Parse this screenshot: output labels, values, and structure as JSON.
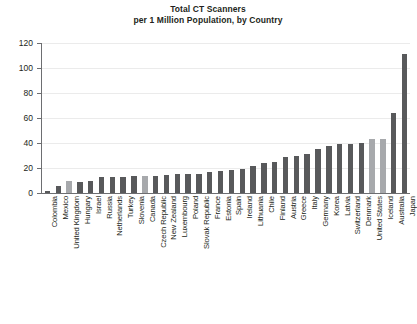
{
  "chart": {
    "title_line1": "Total CT Scanners",
    "title_line2": "per 1 Million Population, by Country"
  },
  "chart_data": {
    "type": "bar",
    "title": "Total CT Scanners per 1 Million Population, by Country",
    "xlabel": "",
    "ylabel": "",
    "ylim": [
      0,
      120
    ],
    "yticks": [
      0,
      20,
      40,
      60,
      80,
      100,
      120
    ],
    "grid": true,
    "legend": "none",
    "categories": [
      "Colombia",
      "Mexico",
      "United Kingdom",
      "Hungary",
      "Israel",
      "Russia",
      "Netherlands",
      "Turkey",
      "Slovenia",
      "Canada",
      "Czech Republic",
      "New Zealand",
      "Luxembourg",
      "Poland",
      "Slovak Republic",
      "France",
      "Estonia",
      "Spain",
      "Ireland",
      "Lithuania",
      "Chile",
      "Finland",
      "Austria",
      "Greece",
      "Italy",
      "Germany",
      "Korea",
      "Latvia",
      "Switzerland",
      "Denmark",
      "United States",
      "Iceland",
      "Australia",
      "Japan"
    ],
    "values": [
      1.5,
      6,
      9.5,
      9,
      9.5,
      13,
      13,
      13,
      13.5,
      14,
      14,
      14.5,
      15,
      15,
      15,
      17,
      18,
      18.5,
      19,
      22,
      24,
      25,
      28.5,
      29.5,
      31,
      35,
      38,
      39,
      39.5,
      40,
      43,
      43.5,
      64,
      111
    ],
    "highlighted": [
      "United Kingdom",
      "Canada",
      "United States",
      "Iceland"
    ],
    "bar_color": "#58595b",
    "highlight_color": "#a7a9ac"
  }
}
